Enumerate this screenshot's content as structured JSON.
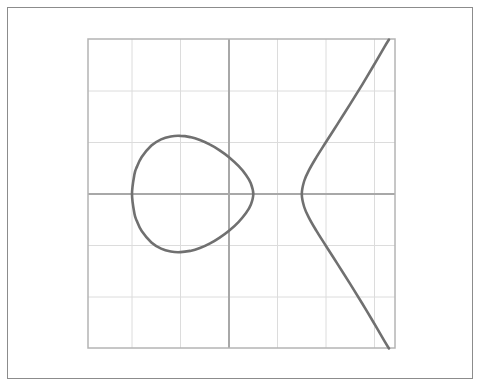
{
  "figure": {
    "frame": {
      "x": 7,
      "y": 7,
      "w": 466,
      "h": 372,
      "color": "#8c8c8c"
    },
    "plot_area": {
      "x": 88,
      "y": 39,
      "w": 307,
      "h": 309
    }
  },
  "colors": {
    "grid": "#dcdcdc",
    "axis": "#a8a8a8",
    "box": "#b4b4b4",
    "curve": "#707070"
  },
  "chart_data": {
    "type": "line",
    "title": "",
    "xlabel": "",
    "ylabel": "",
    "equation": "y^2 = 0.34 (x + 2)(x - 0.5)(x - 1.5)",
    "roots": [
      -2,
      0.5,
      1.5
    ],
    "grid": true,
    "tick_labels": false,
    "xlim": [
      -2.92,
      3.42
    ],
    "ylim": [
      -3,
      3
    ],
    "x_gridlines": [
      -2,
      -1,
      0,
      1,
      2,
      3
    ],
    "y_gridlines": [
      -2,
      -1,
      0,
      1,
      2
    ],
    "pixel_mapping": {
      "origin_x": 229,
      "origin_y": 194,
      "unit_x": 48.5,
      "unit_y": 51.5
    },
    "series": [
      {
        "name": "oval",
        "closed": true,
        "upper_half": [
          [
            -2.0,
            0
          ],
          [
            -1.95,
            0.379
          ],
          [
            -1.9,
            0.527
          ],
          [
            -1.8,
            0.718
          ],
          [
            -1.6,
            0.941
          ],
          [
            -1.4,
            1.06
          ],
          [
            -1.2,
            1.117
          ],
          [
            -1.0,
            1.129
          ],
          [
            -0.8,
            1.104
          ],
          [
            -0.6,
            1.049
          ],
          [
            -0.4,
            0.964
          ],
          [
            -0.2,
            0.853
          ],
          [
            0.0,
            0.714
          ],
          [
            0.2,
            0.54
          ],
          [
            0.35,
            0.371
          ],
          [
            0.45,
            0.209
          ],
          [
            0.5,
            0
          ]
        ]
      },
      {
        "name": "unbounded-branch",
        "closed": false,
        "upper_half": [
          [
            1.5,
            0
          ],
          [
            1.55,
            0.252
          ],
          [
            1.65,
            0.463
          ],
          [
            1.8,
            0.71
          ],
          [
            2.0,
            1.01
          ],
          [
            2.25,
            1.377
          ],
          [
            2.5,
            1.749
          ],
          [
            2.75,
            2.131
          ],
          [
            3.0,
            2.525
          ],
          [
            3.2,
            2.849
          ],
          [
            3.3,
            3.0
          ]
        ]
      }
    ]
  }
}
